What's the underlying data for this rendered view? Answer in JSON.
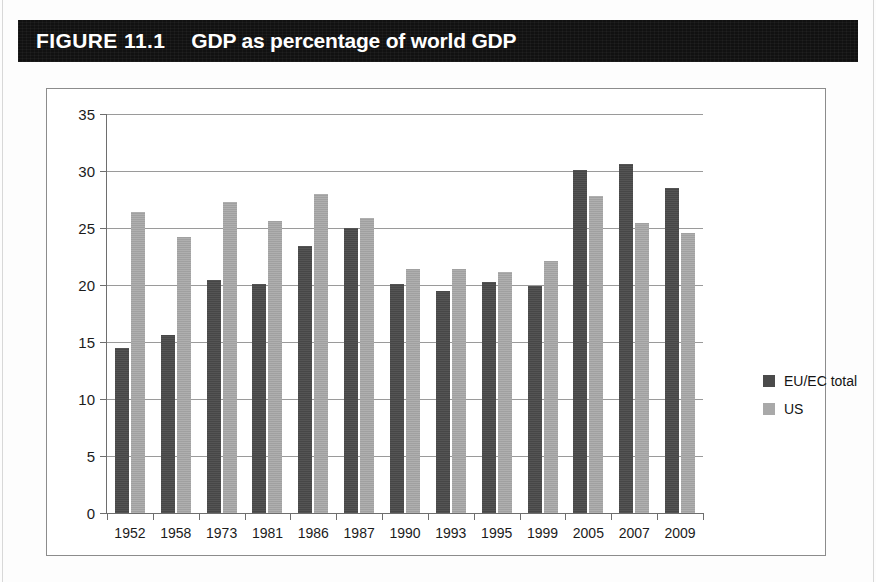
{
  "figure": {
    "label": "FIGURE 11.1",
    "title": "GDP as percentage of world GDP",
    "banner_color": "#111111",
    "banner_text_color": "#ffffff"
  },
  "legend": {
    "position": "right",
    "items": [
      {
        "label": "EU/EC total",
        "color": "#4b4b4b",
        "key": "eu"
      },
      {
        "label": "US",
        "color": "#a9a9a9",
        "key": "us"
      }
    ]
  },
  "source_note": "",
  "chart_data": {
    "type": "bar",
    "title": "GDP as percentage of world GDP",
    "xlabel": "",
    "ylabel": "",
    "ylim": [
      0,
      35
    ],
    "yticks": [
      0,
      5,
      10,
      15,
      20,
      25,
      30,
      35
    ],
    "grid": true,
    "legend_position": "right",
    "categories": [
      "1952",
      "1958",
      "1973",
      "1981",
      "1986",
      "1987",
      "1990",
      "1993",
      "1995",
      "1999",
      "2005",
      "2007",
      "2009"
    ],
    "series": [
      {
        "name": "EU/EC total",
        "color": "#4b4b4b",
        "values": [
          14.5,
          15.6,
          20.4,
          20.1,
          23.4,
          25.0,
          20.1,
          19.5,
          20.3,
          19.9,
          30.1,
          30.6,
          28.5
        ]
      },
      {
        "name": "US",
        "color": "#a9a9a9",
        "values": [
          26.4,
          24.2,
          27.3,
          25.6,
          28.0,
          25.9,
          21.4,
          21.4,
          21.1,
          22.1,
          27.8,
          25.4,
          24.6
        ]
      }
    ]
  }
}
